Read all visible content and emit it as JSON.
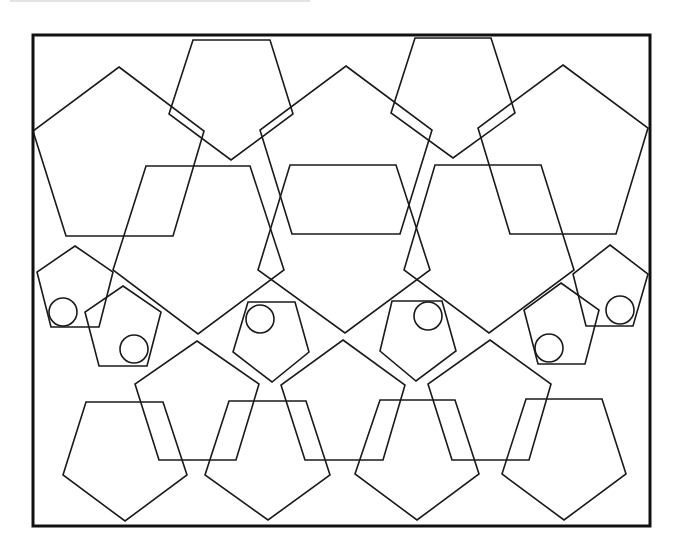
{
  "diagram": {
    "stroke_color": "#1a1a1a",
    "frame_stroke_color": "#111111",
    "background": "#ffffff",
    "frame": {
      "x": 33,
      "y": 35,
      "width": 617,
      "height": 491,
      "stroke_width": 3
    },
    "shape_counts": {
      "large_pentagons": 19,
      "small_pentagons": 6,
      "circles": 6
    },
    "pentagons": [
      {
        "id": "A1",
        "row": "top-large-up",
        "points": [
          [
            119,
            67
          ],
          [
            204,
            131
          ],
          [
            173,
            236
          ],
          [
            66,
            236
          ],
          [
            33,
            131
          ]
        ]
      },
      {
        "id": "A2",
        "row": "top-large-up",
        "points": [
          [
            346,
            66
          ],
          [
            432,
            130
          ],
          [
            400,
            234
          ],
          [
            292,
            234
          ],
          [
            260,
            130
          ]
        ]
      },
      {
        "id": "A3",
        "row": "top-large-up",
        "points": [
          [
            563,
            65
          ],
          [
            648,
            128
          ],
          [
            616,
            234
          ],
          [
            510,
            234
          ],
          [
            478,
            128
          ]
        ]
      },
      {
        "id": "B1",
        "row": "top-down",
        "points": [
          [
            193,
            40
          ],
          [
            270,
            40
          ],
          [
            293,
            114
          ],
          [
            231,
            160
          ],
          [
            169,
            114
          ]
        ]
      },
      {
        "id": "B2",
        "row": "top-down",
        "points": [
          [
            415,
            38
          ],
          [
            491,
            38
          ],
          [
            515,
            113
          ],
          [
            453,
            158
          ],
          [
            391,
            113
          ]
        ]
      },
      {
        "id": "C1",
        "row": "middle-down",
        "points": [
          [
            146,
            166
          ],
          [
            250,
            166
          ],
          [
            284,
            270
          ],
          [
            198,
            334
          ],
          [
            113,
            270
          ]
        ]
      },
      {
        "id": "C2",
        "row": "middle-down",
        "points": [
          [
            290,
            165
          ],
          [
            396,
            165
          ],
          [
            430,
            270
          ],
          [
            345,
            333
          ],
          [
            258,
            270
          ]
        ]
      },
      {
        "id": "C3",
        "row": "middle-down",
        "points": [
          [
            435,
            165
          ],
          [
            541,
            165
          ],
          [
            574,
            270
          ],
          [
            489,
            333
          ],
          [
            404,
            270
          ]
        ]
      },
      {
        "id": "D1",
        "row": "lower-up",
        "points": [
          [
            197,
            341
          ],
          [
            259,
            384
          ],
          [
            236,
            460
          ],
          [
            159,
            460
          ],
          [
            135,
            384
          ]
        ]
      },
      {
        "id": "D2",
        "row": "lower-up",
        "points": [
          [
            343,
            340
          ],
          [
            405,
            385
          ],
          [
            383,
            460
          ],
          [
            305,
            460
          ],
          [
            281,
            385
          ]
        ]
      },
      {
        "id": "D3",
        "row": "lower-up",
        "points": [
          [
            490,
            340
          ],
          [
            551,
            384
          ],
          [
            529,
            460
          ],
          [
            452,
            460
          ],
          [
            428,
            384
          ]
        ]
      },
      {
        "id": "E1",
        "row": "bottom-down",
        "points": [
          [
            86,
            402
          ],
          [
            163,
            402
          ],
          [
            187,
            475
          ],
          [
            125,
            521
          ],
          [
            63,
            475
          ]
        ]
      },
      {
        "id": "E2",
        "row": "bottom-down",
        "points": [
          [
            229,
            401
          ],
          [
            306,
            401
          ],
          [
            330,
            475
          ],
          [
            268,
            520
          ],
          [
            205,
            475
          ]
        ]
      },
      {
        "id": "E3",
        "row": "bottom-down",
        "points": [
          [
            380,
            400
          ],
          [
            455,
            400
          ],
          [
            479,
            474
          ],
          [
            417,
            520
          ],
          [
            355,
            474
          ]
        ]
      },
      {
        "id": "E4",
        "row": "bottom-down",
        "points": [
          [
            526,
            399
          ],
          [
            602,
            399
          ],
          [
            626,
            474
          ],
          [
            564,
            520
          ],
          [
            502,
            474
          ]
        ]
      }
    ],
    "small_pentagons": [
      {
        "id": "S1",
        "points": [
          [
            75,
            246
          ],
          [
            113,
            272
          ],
          [
            99,
            327
          ],
          [
            51,
            327
          ],
          [
            37,
            272
          ]
        ],
        "circle": {
          "cx": 63,
          "cy": 312,
          "r": 14
        }
      },
      {
        "id": "S2",
        "points": [
          [
            123,
            286
          ],
          [
            161,
            312
          ],
          [
            147,
            366
          ],
          [
            99,
            366
          ],
          [
            85,
            312
          ]
        ],
        "circle": {
          "cx": 134,
          "cy": 349,
          "r": 14
        }
      },
      {
        "id": "S3",
        "points": [
          [
            248,
            302
          ],
          [
            295,
            302
          ],
          [
            309,
            352
          ],
          [
            272,
            382
          ],
          [
            233,
            352
          ]
        ],
        "circle": {
          "cx": 260,
          "cy": 319,
          "r": 14
        }
      },
      {
        "id": "S4",
        "points": [
          [
            392,
            301
          ],
          [
            442,
            301
          ],
          [
            456,
            351
          ],
          [
            416,
            381
          ],
          [
            380,
            351
          ]
        ],
        "circle": {
          "cx": 428,
          "cy": 316,
          "r": 14
        }
      },
      {
        "id": "S5",
        "points": [
          [
            610,
            245
          ],
          [
            648,
            274
          ],
          [
            633,
            326
          ],
          [
            586,
            326
          ],
          [
            573,
            274
          ]
        ],
        "circle": {
          "cx": 620,
          "cy": 310,
          "r": 14
        }
      },
      {
        "id": "S6",
        "points": [
          [
            561,
            283
          ],
          [
            599,
            310
          ],
          [
            585,
            364
          ],
          [
            538,
            364
          ],
          [
            524,
            310
          ]
        ],
        "circle": {
          "cx": 549,
          "cy": 348,
          "r": 14
        }
      }
    ]
  }
}
